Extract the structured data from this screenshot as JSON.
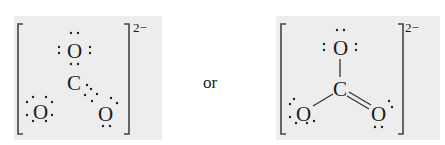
{
  "figure": {
    "connector_text": "or",
    "left_structure": {
      "name": "carbonate-electron-dot",
      "charge": "2−",
      "atoms": [
        {
          "id": "O_top",
          "symbol": "O"
        },
        {
          "id": "C",
          "symbol": "C"
        },
        {
          "id": "O_left",
          "symbol": "O"
        },
        {
          "id": "O_right",
          "symbol": "O"
        }
      ],
      "bond_notation": "dots"
    },
    "right_structure": {
      "name": "carbonate-line-bond",
      "charge": "2−",
      "atoms": [
        {
          "id": "O_top",
          "symbol": "O"
        },
        {
          "id": "C",
          "symbol": "C"
        },
        {
          "id": "O_left",
          "symbol": "O"
        },
        {
          "id": "O_right",
          "symbol": "O"
        }
      ],
      "bonds": [
        {
          "from": "C",
          "to": "O_top",
          "order": 1
        },
        {
          "from": "C",
          "to": "O_left",
          "order": 1
        },
        {
          "from": "C",
          "to": "O_right",
          "order": 2
        }
      ]
    }
  }
}
